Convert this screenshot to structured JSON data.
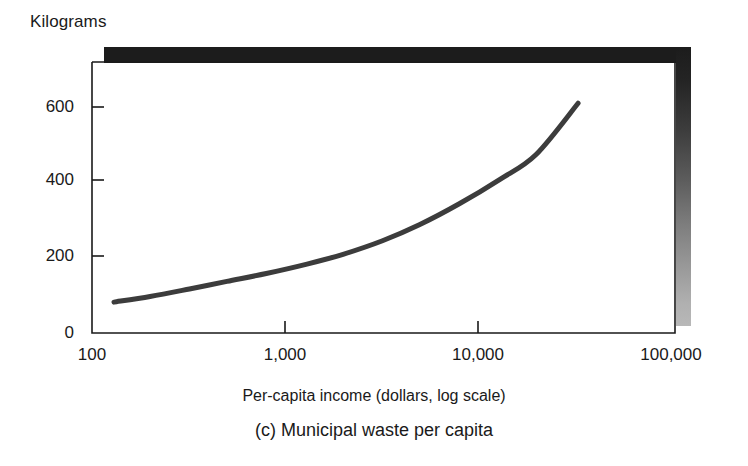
{
  "figure": {
    "y_unit_label": "Kilograms",
    "axis_title": "Per-capita income (dollars, log scale)",
    "caption": "(c) Municipal waste per capita"
  },
  "chart_data": {
    "type": "line",
    "title": "(c) Municipal waste per capita",
    "xlabel": "Per-capita income (dollars, log scale)",
    "ylabel": "Kilograms",
    "xscale": "log",
    "yscale": "linear",
    "xlim": [
      100,
      100000
    ],
    "ylim": [
      0,
      700
    ],
    "grid": false,
    "legend": null,
    "xticks": [
      100,
      1000,
      10000,
      100000
    ],
    "xticklabels": [
      "100",
      "1,000",
      "10,000",
      "100,000"
    ],
    "yticks": [
      0,
      200,
      400,
      600
    ],
    "yticklabels": [
      "0",
      "200",
      "400",
      "600"
    ],
    "series": [
      {
        "name": "Municipal waste per capita",
        "color": "#3c3c3c",
        "linewidth": 5,
        "x": [
          130,
          200,
          320,
          500,
          800,
          1300,
          2000,
          3200,
          5000,
          8000,
          13000,
          20000,
          33000
        ],
        "y": [
          82,
          97,
          117,
          137,
          158,
          183,
          209,
          245,
          288,
          343,
          408,
          474,
          610
        ]
      }
    ],
    "annotations": []
  },
  "ticks": {
    "y": [
      {
        "label": "600",
        "value": 600
      },
      {
        "label": "400",
        "value": 400
      },
      {
        "label": "200",
        "value": 200
      },
      {
        "label": "0",
        "value": 0
      }
    ],
    "x": [
      {
        "label": "100",
        "value": 100
      },
      {
        "label": "1,000",
        "value": 1000
      },
      {
        "label": "10,000",
        "value": 10000
      },
      {
        "label": "100,000",
        "value": 100000
      }
    ]
  },
  "colors": {
    "curve": "#3c3c3c",
    "axis": "#1a1a1a",
    "shadow_dark": "#1c1c1c",
    "shadow_light": "#b8b8b8",
    "background": "#ffffff"
  }
}
